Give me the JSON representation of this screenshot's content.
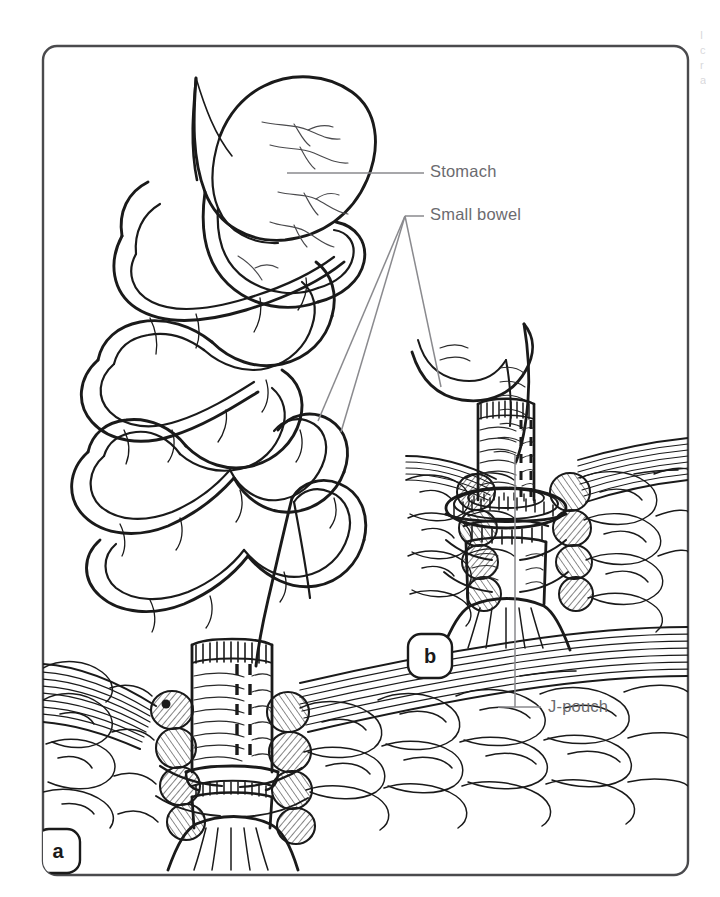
{
  "figure": {
    "kind": "medical-illustration",
    "panel": {
      "border_color": "#4a4a4d",
      "background": "#ffffff",
      "corner_radius": 14
    },
    "ink_color": "#1a1a1a",
    "leader_color": "#8a8a8e",
    "label_color": "#6b6b6f"
  },
  "annotations": [
    {
      "id": "stomach",
      "label": "Stomach",
      "label_x": 430,
      "label_y": 166,
      "leader": {
        "x1": 287,
        "y1": 173,
        "x2": 424,
        "y2": 173
      }
    },
    {
      "id": "small-bowel",
      "label": "Small bowel",
      "label_x": 430,
      "label_y": 231,
      "leader": {
        "x1": 405,
        "y1": 216,
        "x2": 424,
        "y2": 216
      },
      "branches": [
        {
          "x1": 405,
          "y1": 216,
          "x2": 318,
          "y2": 421
        },
        {
          "x1": 405,
          "y1": 216,
          "x2": 340,
          "y2": 431
        },
        {
          "x1": 405,
          "y1": 216,
          "x2": 440,
          "y2": 386
        }
      ]
    },
    {
      "id": "j-pouch",
      "label": "J-pouch",
      "label_x": 548,
      "label_y": 699,
      "leader": {
        "x1": 515,
        "y1": 707,
        "x2": 541,
        "y2": 707
      },
      "stem": {
        "x1": 515,
        "y1": 455,
        "x2": 515,
        "y2": 707
      }
    }
  ],
  "panels": [
    {
      "id": "panel-a",
      "label": "a",
      "badge_x": 36,
      "badge_y": 829,
      "badge_w": 44,
      "badge_h": 44
    },
    {
      "id": "panel-b",
      "label": "b",
      "badge_x": 408,
      "badge_y": 634,
      "badge_w": 44,
      "badge_h": 44
    }
  ],
  "caption_fragments": [
    {
      "text": "I",
      "x": 700,
      "y": 34
    },
    {
      "text": "c",
      "x": 700,
      "y": 49
    },
    {
      "text": "r",
      "x": 700,
      "y": 64
    },
    {
      "text": "a",
      "x": 700,
      "y": 79
    }
  ],
  "anatomy": {
    "structures": [
      "stomach",
      "duodenum",
      "jejunum",
      "ileum",
      "small bowel loops",
      "ileal J-pouch",
      "levator ani muscle",
      "internal anal sphincter",
      "external anal sphincter",
      "perianal fat",
      "stapled anastomosis",
      "staple line"
    ]
  }
}
